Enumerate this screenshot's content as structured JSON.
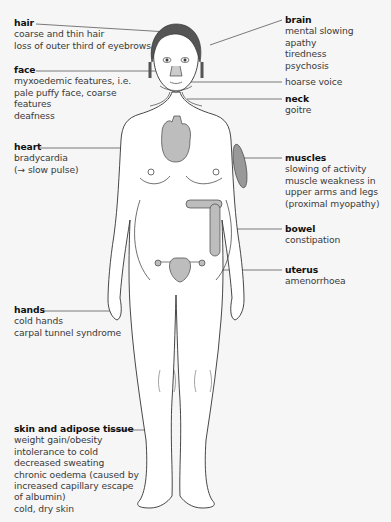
{
  "diagram": {
    "colors": {
      "background": "#f6f6f6",
      "body_fill": "#ffffff",
      "outline": "#333333",
      "hair": "#555555",
      "organ_fill": "#bdbdbd",
      "leader_line": "#444444"
    },
    "labels": {
      "hair": {
        "title": "hair",
        "lines": [
          "coarse and thin hair",
          "loss of outer third of eyebrows"
        ]
      },
      "face": {
        "title": "face",
        "lines": [
          "myxoedemic features, i.e.",
          "pale puffy face, coarse",
          "features",
          "deafness"
        ]
      },
      "heart": {
        "title": "heart",
        "lines": [
          "bradycardia",
          "(→ slow pulse)"
        ]
      },
      "hands": {
        "title": "hands",
        "lines": [
          "cold hands",
          "carpal tunnel syndrome"
        ]
      },
      "skin": {
        "title": "skin and adipose tissue",
        "lines": [
          "weight gain/obesity",
          "intolerance to cold",
          "decreased sweating",
          "chronic oedema (caused by",
          "increased capillary escape",
          "of albumin)",
          "cold, dry skin"
        ]
      },
      "brain": {
        "title": "brain",
        "lines": [
          "mental slowing",
          "apathy",
          "tiredness",
          "psychosis"
        ]
      },
      "voice": {
        "title": "",
        "lines": [
          "hoarse voice"
        ]
      },
      "neck": {
        "title": "neck",
        "lines": [
          "goitre"
        ]
      },
      "muscles": {
        "title": "muscles",
        "lines": [
          "slowing of activity",
          "muscle weakness in",
          "upper arms and legs",
          "(proximal myopathy)"
        ]
      },
      "bowel": {
        "title": "bowel",
        "lines": [
          "constipation"
        ]
      },
      "uterus": {
        "title": "uterus",
        "lines": [
          "amenorrhoea"
        ]
      }
    }
  }
}
